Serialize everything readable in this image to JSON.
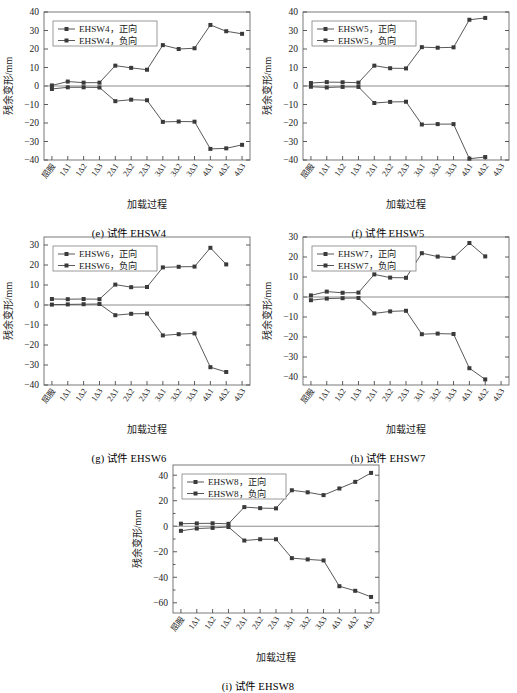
{
  "figure": {
    "axis": {
      "ylabel": "残余变形/mm",
      "xlabel": "加载过程"
    },
    "categories": [
      "屈服",
      "1Δ1",
      "1Δ2",
      "1Δ3",
      "2Δ1",
      "2Δ2",
      "2Δ3",
      "3Δ1",
      "3Δ2",
      "3Δ3",
      "4Δ1",
      "4Δ2",
      "4Δ3"
    ],
    "legend_positive_suffix": "正向",
    "legend_negative_suffix": "负向",
    "series_color": "#3a3a3a"
  },
  "panels": [
    {
      "id": "e",
      "caption": "(e) 试件 EHSW4",
      "specimen": "EHSW4",
      "legend": [
        "EHSW4，正向",
        "EHSW4，负向"
      ],
      "chart_data": {
        "type": "line",
        "title": "(e) 试件 EHSW4",
        "xlabel": "加载过程",
        "ylabel": "残余变形/mm",
        "categories": [
          "屈服",
          "1Δ1",
          "1Δ2",
          "1Δ3",
          "2Δ1",
          "2Δ2",
          "2Δ3",
          "3Δ1",
          "3Δ2",
          "3Δ3",
          "4Δ1",
          "4Δ2",
          "4Δ3"
        ],
        "ylim": [
          -40,
          40
        ],
        "yticks": [
          -40,
          -30,
          -20,
          -10,
          0,
          10,
          20,
          30,
          40
        ],
        "grid": false,
        "legend_position": "upper left",
        "series": [
          {
            "name": "EHSW4，正向",
            "values": [
              0.3,
              2.4,
              1.8,
              1.8,
              11.0,
              9.8,
              8.8,
              22.1,
              20.0,
              20.4,
              33.0,
              29.6,
              28.2
            ]
          },
          {
            "name": "EHSW4，负向",
            "values": [
              -1.6,
              -0.7,
              -0.7,
              -0.8,
              -8.2,
              -7.4,
              -7.7,
              -19.4,
              -19.2,
              -19.3,
              -34.0,
              -33.7,
              -31.8
            ]
          }
        ]
      }
    },
    {
      "id": "f",
      "caption": "(f) 试件 EHSW5",
      "specimen": "EHSW5",
      "legend": [
        "EHSW5，正向",
        "EHSW5，负向"
      ],
      "chart_data": {
        "type": "line",
        "title": "(f) 试件 EHSW5",
        "xlabel": "加载过程",
        "ylabel": "残余变形/mm",
        "categories": [
          "屈服",
          "1Δ1",
          "1Δ2",
          "1Δ3",
          "2Δ1",
          "2Δ2",
          "2Δ3",
          "3Δ1",
          "3Δ2",
          "3Δ3",
          "4Δ1",
          "4Δ2",
          "4Δ3"
        ],
        "ylim": [
          -40,
          40
        ],
        "yticks": [
          -40,
          -30,
          -20,
          -10,
          0,
          10,
          20,
          30,
          40
        ],
        "grid": false,
        "legend_position": "upper left",
        "series": [
          {
            "name": "EHSW5，正向",
            "values": [
              1.6,
              2.1,
              2.0,
              1.8,
              11.0,
              9.6,
              9.5,
              21.0,
              20.7,
              20.9,
              35.8,
              36.8,
              null
            ]
          },
          {
            "name": "EHSW5，负向",
            "values": [
              -0.4,
              -0.8,
              -0.5,
              -0.5,
              -9.2,
              -8.6,
              -8.5,
              -20.8,
              -20.6,
              -20.6,
              -39.3,
              -38.4,
              null
            ]
          }
        ]
      }
    },
    {
      "id": "g",
      "caption": "(g) 试件 EHSW6",
      "specimen": "EHSW6",
      "legend": [
        "EHSW6，正向",
        "EHSW6，负向"
      ],
      "chart_data": {
        "type": "line",
        "title": "(g) 试件 EHSW6",
        "xlabel": "加载过程",
        "ylabel": "残余变形/mm",
        "categories": [
          "屈服",
          "1Δ1",
          "1Δ2",
          "1Δ3",
          "2Δ1",
          "2Δ2",
          "2Δ3",
          "3Δ1",
          "3Δ2",
          "3Δ3",
          "4Δ1",
          "4Δ2",
          "4Δ3"
        ],
        "ylim": [
          -40,
          34
        ],
        "yticks": [
          -40,
          -30,
          -20,
          -10,
          0,
          10,
          20,
          30
        ],
        "grid": false,
        "legend_position": "upper left",
        "series": [
          {
            "name": "EHSW6，正向",
            "values": [
              3.0,
              2.9,
              3.0,
              2.9,
              10.2,
              8.9,
              9.0,
              18.8,
              19.1,
              19.2,
              28.6,
              20.3,
              null
            ]
          },
          {
            "name": "EHSW6，负向",
            "values": [
              0.2,
              0.3,
              0.4,
              0.5,
              -5.1,
              -4.4,
              -4.3,
              -15.2,
              -14.6,
              -14.2,
              -31.1,
              -33.5,
              null
            ]
          }
        ]
      }
    },
    {
      "id": "h",
      "caption": "(h) 试件 EHSW7",
      "specimen": "EHSW7",
      "legend": [
        "EHSW7，正向",
        "EHSW7，负向"
      ],
      "chart_data": {
        "type": "line",
        "title": "(h) 试件 EHSW7",
        "xlabel": "加载过程",
        "ylabel": "残余变形/mm",
        "categories": [
          "屈服",
          "1Δ1",
          "1Δ2",
          "1Δ3",
          "2Δ1",
          "2Δ2",
          "2Δ3",
          "3Δ1",
          "3Δ2",
          "3Δ3",
          "4Δ1",
          "4Δ2",
          "4Δ3"
        ],
        "ylim": [
          -44,
          30
        ],
        "yticks": [
          -40,
          -30,
          -20,
          -10,
          0,
          10,
          20,
          30
        ],
        "grid": false,
        "legend_position": "upper left",
        "series": [
          {
            "name": "EHSW7，正向",
            "values": [
              0.8,
              2.7,
              2.1,
              2.2,
              11.3,
              9.7,
              9.6,
              21.9,
              20.2,
              19.6,
              27.0,
              20.3,
              null
            ]
          },
          {
            "name": "EHSW7，负向",
            "values": [
              -1.6,
              -0.8,
              -0.6,
              -0.5,
              -8.2,
              -7.2,
              -6.9,
              -18.6,
              -18.3,
              -18.5,
              -35.6,
              -41.2,
              null
            ]
          }
        ]
      }
    },
    {
      "id": "i",
      "caption": "(i) 试件 EHSW8",
      "specimen": "EHSW8",
      "legend": [
        "EHSW8，正向",
        "EHSW8，负向"
      ],
      "chart_data": {
        "type": "line",
        "title": "(i) 试件 EHSW8",
        "xlabel": "加载过程",
        "ylabel": "残余变形/mm",
        "categories": [
          "屈服",
          "1Δ1",
          "1Δ2",
          "1Δ3",
          "2Δ1",
          "2Δ2",
          "2Δ3",
          "3Δ1",
          "3Δ2",
          "3Δ3",
          "4Δ1",
          "4Δ2",
          "4Δ3"
        ],
        "ylim": [
          -68,
          48
        ],
        "yticks": [
          -60,
          -40,
          -20,
          0,
          20,
          40
        ],
        "grid": false,
        "legend_position": "upper left",
        "series": [
          {
            "name": "EHSW8，正向",
            "values": [
              2.0,
              2.2,
              2.3,
              1.9,
              15.0,
              14.2,
              14.0,
              28.2,
              26.6,
              24.4,
              29.6,
              34.8,
              41.8
            ]
          },
          {
            "name": "EHSW8，负向",
            "values": [
              -3.6,
              -1.8,
              -1.3,
              -0.6,
              -11.2,
              -10.2,
              -10.2,
              -25.0,
              -26.0,
              -26.8,
              -47.0,
              -50.6,
              -55.4
            ]
          }
        ]
      }
    }
  ]
}
